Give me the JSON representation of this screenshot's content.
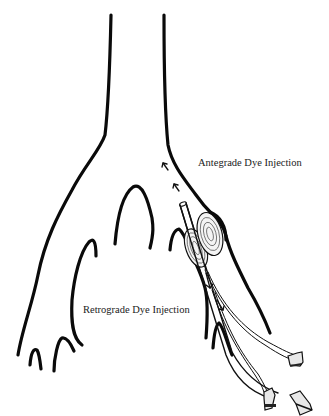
{
  "figure": {
    "type": "medical illustration",
    "labels": {
      "antegrade": "Antegrade Dye Injection",
      "retrograde": "Retrograde Dye Injection"
    },
    "elements": {
      "main_trunk": "vessel-trunk",
      "branches": [
        "left-branch",
        "middle-branch",
        "right-branch"
      ],
      "catheter": "double-balloon-catheter",
      "balloon_count": 2,
      "hub_count": 3,
      "antegrade_arrows": 2,
      "retrograde_arrows": 2
    },
    "colors": {
      "stroke": "#0a0a0a",
      "background": "#ffffff",
      "text": "#222222"
    }
  }
}
